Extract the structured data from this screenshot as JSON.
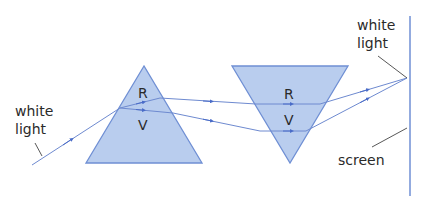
{
  "colors": {
    "prism_fill": "#b9cdee",
    "prism_stroke": "#6f8fd4",
    "ray": "#6e8ad0",
    "arrow": "#4a6cc8",
    "screen": "#6f8fd4",
    "leader": "#444444",
    "text": "#2a2a2a"
  },
  "labels": {
    "white_light_in_line1": "white",
    "white_light_in_line2": "light",
    "prism1_red": "R",
    "prism1_violet": "V",
    "prism2_red": "R",
    "prism2_violet": "V",
    "white_light_out_line1": "white",
    "white_light_out_line2": "light",
    "screen": "screen"
  }
}
